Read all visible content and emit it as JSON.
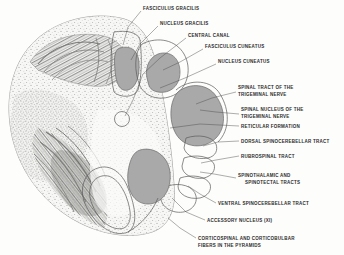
{
  "figure": {
    "colors": {
      "nucleus_gray": "#a9a9a9",
      "outline_stroke": "#5a5a5a",
      "leader_stroke": "#4a4a4a",
      "label_text": "#2b2b2b",
      "tissue_light": "#efefed",
      "tissue_dark": "#5d5d5d",
      "background": "#fdfdfc"
    }
  },
  "labels": [
    {
      "id": "fasciculus-gracilis",
      "text": "FASCICULUS GRACILIS",
      "x": 143,
      "y": 9.5,
      "anchor": "start"
    },
    {
      "id": "nucleus-gracilis",
      "text": "NUCLEUS GRACILIS",
      "x": 160,
      "y": 24.5,
      "anchor": "start"
    },
    {
      "id": "central-canal",
      "text": "CENTRAL CANAL",
      "x": 188,
      "y": 36.5,
      "anchor": "start"
    },
    {
      "id": "fasciculus-cuneatus",
      "text": "FASCICULUS CUNEATUS",
      "x": 205,
      "y": 47.5,
      "anchor": "start"
    },
    {
      "id": "nucleus-cuneatus",
      "text": "NUCLEUS CUNEATUS",
      "x": 218,
      "y": 62.5,
      "anchor": "start"
    },
    {
      "id": "spinal-tract-trigeminal-1",
      "text": "SPINAL TRACT OF THE",
      "x": 238,
      "y": 88.5,
      "anchor": "start"
    },
    {
      "id": "spinal-tract-trigeminal-2",
      "text": "TRIGEMINAL NERVE",
      "x": 238,
      "y": 95.5,
      "anchor": "start"
    },
    {
      "id": "spinal-nucleus-trigeminal-1",
      "text": "SPINAL NUCLEUS OF THE",
      "x": 241,
      "y": 110.5,
      "anchor": "start"
    },
    {
      "id": "spinal-nucleus-trigeminal-2",
      "text": "TRIGEMINAL NERVE",
      "x": 241,
      "y": 117.5,
      "anchor": "start"
    },
    {
      "id": "reticular-formation",
      "text": "RETICULAR FORMATION",
      "x": 241,
      "y": 127.5,
      "anchor": "start"
    },
    {
      "id": "dorsal-spinocerebellar",
      "text": "DORSAL SPINOCEREBELLAR TRACT",
      "x": 241,
      "y": 142.5,
      "anchor": "start"
    },
    {
      "id": "rubrospinal-tract",
      "text": "RUBROSPINAL TRACT",
      "x": 241,
      "y": 157.5,
      "anchor": "start"
    },
    {
      "id": "spinothalamic-1",
      "text": "SPINOTHALAMIC AND",
      "x": 238,
      "y": 176.5,
      "anchor": "start"
    },
    {
      "id": "spinothalamic-2",
      "text": "SPINOTECTAL TRACTS",
      "x": 245,
      "y": 183.5,
      "anchor": "start"
    },
    {
      "id": "ventral-spinocerebellar",
      "text": "VENTRAL SPINOCEREBELLAR TRACT",
      "x": 218,
      "y": 204.5,
      "anchor": "start"
    },
    {
      "id": "accessory-nucleus",
      "text": "ACCESSORY NUCLEUS (XI)",
      "x": 207,
      "y": 221.5,
      "anchor": "start"
    },
    {
      "id": "corticospinal-1",
      "text": "CORTICOSPINAL AND CORTICOBULBAR",
      "x": 198,
      "y": 239.5,
      "anchor": "start"
    },
    {
      "id": "corticospinal-2",
      "text": "FIBERS IN THE PYRAMIDS",
      "x": 198,
      "y": 246.5,
      "anchor": "start"
    }
  ],
  "leaders": [
    {
      "id": "leader-fasciculus-gracilis",
      "d": "M 141 11 L 128 27 L 123 45"
    },
    {
      "id": "leader-nucleus-gracilis",
      "d": "M 158 26 L 140 44 L 131 60"
    },
    {
      "id": "leader-central-canal",
      "d": "M 186 38 L 160 58 L 143 74"
    },
    {
      "id": "leader-fasciculus-cuneatus",
      "d": "M 203 49 L 180 62 L 163 70"
    },
    {
      "id": "leader-nucleus-cuneatus",
      "d": "M 216 64 L 185 78 L 160 88"
    },
    {
      "id": "leader-spinal-tract-trigeminal",
      "d": "M 236 92 L 212 98 L 196 104"
    },
    {
      "id": "leader-spinal-nucleus-trigeminal",
      "d": "M 239 114 L 216 112 L 200 110"
    },
    {
      "id": "leader-reticular-formation",
      "d": "M 239 126 L 200 124 L 170 128"
    },
    {
      "id": "leader-dorsal-spinocerebellar",
      "d": "M 239 141 L 218 142 L 203 146"
    },
    {
      "id": "leader-rubrospinal",
      "d": "M 239 156 L 216 160 L 201 163"
    },
    {
      "id": "leader-spinothalamic",
      "d": "M 236 178 L 214 174 L 200 172"
    },
    {
      "id": "leader-ventral-spinocerebellar",
      "d": "M 216 203 L 200 194 L 188 186"
    },
    {
      "id": "leader-accessory-nucleus",
      "d": "M 205 220 L 186 212 L 172 198"
    },
    {
      "id": "leader-corticospinal",
      "d": "M 196 238 L 180 228 L 168 218"
    },
    {
      "id": "leader-central-canal-2",
      "d": "M 143 74 L 133 100 L 125 116"
    }
  ],
  "structures": [
    {
      "id": "nucleus-gracilis-shape",
      "name": "nucleus-gracilis",
      "type": "filled"
    },
    {
      "id": "nucleus-cuneatus-shape",
      "name": "nucleus-cuneatus",
      "type": "filled"
    },
    {
      "id": "spinal-nucleus-shape",
      "name": "spinal-nucleus-of-trigeminal-nerve",
      "type": "filled"
    },
    {
      "id": "accessory-nucleus-shape",
      "name": "accessory-nucleus",
      "type": "filled"
    },
    {
      "id": "central-canal-shape",
      "name": "central-canal",
      "type": "outline"
    },
    {
      "id": "fasciculus-gracilis-shape",
      "name": "fasciculus-gracilis",
      "type": "outline"
    },
    {
      "id": "fasciculus-cuneatus-shape",
      "name": "fasciculus-cuneatus",
      "type": "outline"
    },
    {
      "id": "dorsal-spinocerebellar-shape",
      "name": "dorsal-spinocerebellar-tract",
      "type": "outline"
    },
    {
      "id": "rubrospinal-shape",
      "name": "rubrospinal-tract",
      "type": "outline"
    },
    {
      "id": "spinothalamic-shape",
      "name": "spinothalamic-and-spinotectal-tracts",
      "type": "outline"
    },
    {
      "id": "ventral-spinocerebellar-shape",
      "name": "ventral-spinocerebellar-tract",
      "type": "outline"
    },
    {
      "id": "pyramid-shape",
      "name": "pyramid-corticospinal-fibers",
      "type": "outline"
    },
    {
      "id": "inferior-olivary-shape",
      "name": "inferior-olivary-nucleus",
      "type": "textured"
    }
  ]
}
